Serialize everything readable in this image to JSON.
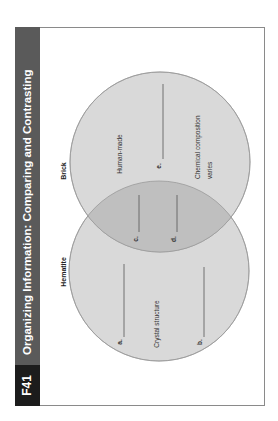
{
  "header": {
    "code": "F41",
    "title": "Organizing Information: Comparing and Contrasting",
    "band_color": "#5a5a5a",
    "code_color": "#1c1c1c"
  },
  "venn": {
    "circles": [
      {
        "name": "Hematite",
        "fill": "#d9d9d9"
      },
      {
        "name": "Brick",
        "fill": "#d9d9d9"
      }
    ],
    "overlap_fill": "#bfbfbf",
    "hematite": {
      "title": "Hematite",
      "blanks": [
        {
          "label": "a."
        },
        {
          "label": "b."
        }
      ],
      "facts": [
        "Crystal structure"
      ]
    },
    "both": {
      "blanks": [
        {
          "label": "c."
        },
        {
          "label": "d."
        }
      ]
    },
    "brick": {
      "title": "Brick",
      "blanks": [
        {
          "label": "e."
        }
      ],
      "facts": [
        "Human-made"
      ],
      "fact2_line1": "Chemical composition",
      "fact2_line2": "varies"
    }
  }
}
